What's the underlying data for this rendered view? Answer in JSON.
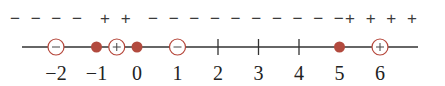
{
  "diagram": {
    "type": "sign-chart-number-line",
    "axis": {
      "min_visible": -2.7,
      "max_visible": 7.1,
      "labels": [
        "−2",
        "−1",
        "0",
        "1",
        "2",
        "3",
        "4",
        "5",
        "6"
      ],
      "label_values": [
        -2,
        -1,
        0,
        1,
        2,
        3,
        4,
        5,
        6
      ]
    },
    "sign_groups": [
      {
        "text": "− − − −",
        "x": 10
      },
      {
        "text": "+ +",
        "x": 100
      },
      {
        "text": "− − − − − − − − − −",
        "x": 148
      },
      {
        "text": "+ + + +",
        "x": 345
      }
    ],
    "markers": [
      {
        "value": -2,
        "kind": "open",
        "symbol": "−"
      },
      {
        "value": -1,
        "kind": "filled"
      },
      {
        "value": -0.5,
        "kind": "open",
        "symbol": "+"
      },
      {
        "value": 0,
        "kind": "filled"
      },
      {
        "value": 1,
        "kind": "open",
        "symbol": "−"
      },
      {
        "value": 2,
        "kind": "tick"
      },
      {
        "value": 3,
        "kind": "tick"
      },
      {
        "value": 4,
        "kind": "tick"
      },
      {
        "value": 5,
        "kind": "filled"
      },
      {
        "value": 6,
        "kind": "open",
        "symbol": "+"
      }
    ],
    "colors": {
      "line": "#333333",
      "marker": "#b5463a",
      "marker_fill": "#b24a3e",
      "text": "#222222"
    }
  }
}
